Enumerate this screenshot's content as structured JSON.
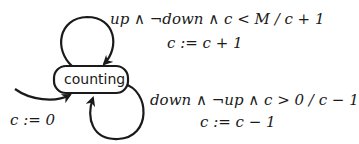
{
  "diagram": {
    "type": "state-machine",
    "colors": {
      "stroke": "#1a1a1a",
      "background": "#ffffff"
    },
    "states": [
      {
        "id": "counting",
        "label": "counting"
      }
    ],
    "initial_transition": {
      "target": "counting",
      "action": "c := 0"
    },
    "transitions": [
      {
        "from": "counting",
        "to": "counting",
        "guard_action": "up ∧ ¬down ∧ c < M / c + 1",
        "update": "c := c + 1"
      },
      {
        "from": "counting",
        "to": "counting",
        "guard_action": "down ∧ ¬up ∧ c > 0 / c − 1",
        "update": "c := c − 1"
      }
    ]
  }
}
